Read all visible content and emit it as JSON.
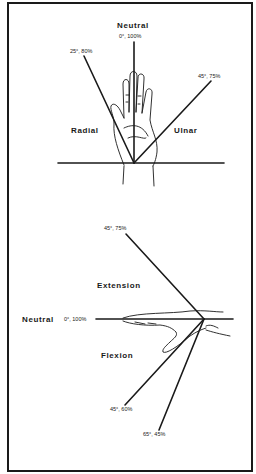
{
  "diagram": {
    "colors": {
      "ink": "#1a1a1a",
      "background": "#ffffff"
    },
    "top_panel": {
      "title": "Wrist Radial / Ulnar Deviation",
      "labels": {
        "neutral": "Neutral",
        "neutral_value": "0°, 100%",
        "radial": "Radial",
        "radial_value": "25°, 80%",
        "ulnar": "Ulnar",
        "ulnar_value": "45°, 75%"
      }
    },
    "bottom_panel": {
      "title": "Wrist Flexion / Extension",
      "labels": {
        "neutral": "Neutral",
        "neutral_value": "0°, 100%",
        "extension": "Extension",
        "extension_value": "45°, 75%",
        "flexion": "Flexion",
        "flexion_value_1": "45°, 60%",
        "flexion_value_2": "65°, 45%"
      }
    }
  }
}
